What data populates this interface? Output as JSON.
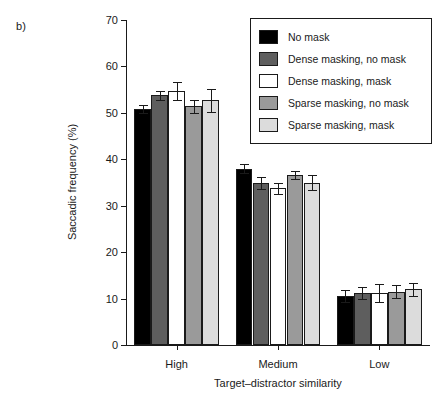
{
  "panel": {
    "label": "b)"
  },
  "legend": {
    "position": "top-right",
    "items": [
      {
        "label": "No mask",
        "color": "#000000"
      },
      {
        "label": "Dense masking, no mask",
        "color": "#5e5e5e"
      },
      {
        "label": "Dense masking, mask",
        "color": "#ffffff"
      },
      {
        "label": "Sparse masking, no mask",
        "color": "#9a9a9a"
      },
      {
        "label": "Sparse masking, mask",
        "color": "#dcdcdc"
      }
    ]
  },
  "chart_data": {
    "type": "bar",
    "title": "",
    "xlabel": "Target–distractor similarity",
    "ylabel": "Saccadic frequency (%)",
    "categories": [
      "High",
      "Medium",
      "Low"
    ],
    "ylim": [
      0,
      70
    ],
    "yticks": [
      0,
      10,
      20,
      30,
      40,
      50,
      60,
      70
    ],
    "ytick_labels": [
      "0",
      "10",
      "20",
      "30",
      "40",
      "50",
      "60",
      "70"
    ],
    "grid": false,
    "error_bars": "standard error",
    "series": [
      {
        "name": "No mask",
        "color": "#000000",
        "values": [
          50.8,
          38.0,
          10.6
        ],
        "errors": [
          0.9,
          0.9,
          1.3
        ]
      },
      {
        "name": "Dense masking, no mask",
        "color": "#5e5e5e",
        "values": [
          53.8,
          34.8,
          11.2
        ],
        "errors": [
          1.0,
          1.3,
          1.3
        ]
      },
      {
        "name": "Dense masking, mask",
        "color": "#ffffff",
        "values": [
          54.7,
          33.8,
          11.2
        ],
        "errors": [
          1.9,
          1.2,
          2.0
        ]
      },
      {
        "name": "Sparse masking, no mask",
        "color": "#9a9a9a",
        "values": [
          51.4,
          36.6,
          11.5
        ],
        "errors": [
          1.4,
          0.9,
          1.4
        ]
      },
      {
        "name": "Sparse masking, mask",
        "color": "#dcdcdc",
        "values": [
          52.7,
          35.0,
          12.0
        ],
        "errors": [
          2.5,
          1.6,
          1.4
        ]
      }
    ]
  }
}
